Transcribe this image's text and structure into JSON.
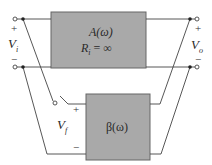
{
  "diagram": {
    "type": "feedback amplifier block diagram",
    "colors": {
      "box_fill": "#a9a9a9",
      "box_stroke": "#666666",
      "wire": "#444444",
      "background": "#ffffff"
    },
    "amplifier_block": {
      "line1": "A(ω)",
      "line2_var": "R",
      "line2_sub": "i",
      "line2_rest": " = ∞"
    },
    "feedback_block": {
      "label": "β(ω)"
    },
    "input_port": {
      "var": "V",
      "sub": "i",
      "plus": "+",
      "minus": "−"
    },
    "output_port": {
      "var": "V",
      "sub": "o",
      "plus": "+",
      "minus": "−"
    },
    "feedback_port": {
      "var": "V",
      "sub": "f",
      "plus": "+",
      "minus": "−"
    },
    "switch": {
      "state": "open"
    }
  }
}
